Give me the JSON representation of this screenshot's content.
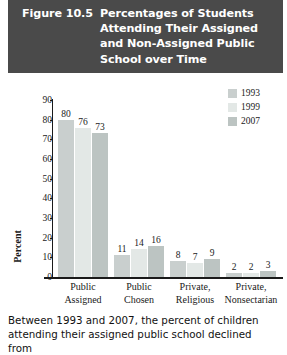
{
  "header": {
    "figure_number": "Figure 10.5",
    "title": "Percentages of Students\nAttending Their Assigned\nand Non-Assigned Public\nSchool over Time",
    "background_color": "#4a4a4a",
    "text_color": "#ffffff"
  },
  "caption": {
    "text": "Between 1993 and 2007, the percent of children\nattending their assigned public school declined from"
  },
  "chart_data": {
    "type": "bar",
    "title": "Percentages of Students Attending Their Assigned and Non-Assigned Public School over Time",
    "xlabel": "",
    "ylabel": "Percent",
    "ylim": [
      0,
      90
    ],
    "ytick_step": 10,
    "yticks": [
      "90",
      "80",
      "70",
      "60",
      "50",
      "40",
      "30",
      "20",
      "10",
      "0"
    ],
    "grid": false,
    "legend_position": "top-right",
    "categories": [
      "Public\nAssigned",
      "Public\nChosen",
      "Private,\nReligious",
      "Private,\nNonsectarian"
    ],
    "series": [
      {
        "name": "1993",
        "color": "#c9cfce",
        "values": [
          80,
          11,
          8,
          2
        ]
      },
      {
        "name": "1999",
        "color": "#e3e8e6",
        "values": [
          76,
          14,
          7,
          2
        ]
      },
      {
        "name": "2007",
        "color": "#bcc4c2",
        "values": [
          73,
          16,
          9,
          3
        ]
      }
    ]
  }
}
